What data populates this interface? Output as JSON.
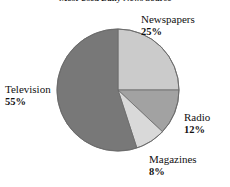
{
  "chart_data": {
    "type": "pie",
    "title": "Most Used Daily News Source",
    "categories": [
      "Newspapers",
      "Radio",
      "Magazines",
      "Television"
    ],
    "values": [
      25,
      12,
      8,
      55
    ],
    "value_labels": [
      "25%",
      "12%",
      "8%",
      "55%"
    ],
    "unit": "%",
    "start_angle_deg": 0,
    "direction": "clockwise",
    "legend": "none",
    "labels_position": "outside-callout",
    "grid": false,
    "slice_colors": [
      "#cbcbcb",
      "#a2a2a2",
      "#d9d9d9",
      "#787878"
    ],
    "outline_color": "#6a6a6a",
    "slices": [
      {
        "name": "Newspapers",
        "value": 25,
        "value_label": "25%",
        "color": "#cbcbcb",
        "start_deg": 0,
        "end_deg": 90,
        "label_side": "right"
      },
      {
        "name": "Radio",
        "value": 12,
        "value_label": "12%",
        "color": "#a2a2a2",
        "start_deg": 90,
        "end_deg": 133.2,
        "label_side": "right"
      },
      {
        "name": "Magazines",
        "value": 8,
        "value_label": "8%",
        "color": "#d9d9d9",
        "start_deg": 133.2,
        "end_deg": 162,
        "label_side": "right"
      },
      {
        "name": "Television",
        "value": 55,
        "value_label": "55%",
        "color": "#787878",
        "start_deg": 162,
        "end_deg": 360,
        "label_side": "left"
      }
    ]
  },
  "chart": {
    "title": "Most Used Daily News Source",
    "newspapers": {
      "name": "Newspapers",
      "pct": "25%"
    },
    "radio": {
      "name": "Radio",
      "pct": "12%"
    },
    "magazines": {
      "name": "Magazines",
      "pct": "8%"
    },
    "television": {
      "name": "Television",
      "pct": "55%"
    }
  },
  "colors": {
    "newspapers": "#cbcbcb",
    "radio": "#a2a2a2",
    "magazines": "#d9d9d9",
    "television": "#787878",
    "outline": "#6a6a6a",
    "text": "#111111",
    "background": "#ffffff"
  }
}
